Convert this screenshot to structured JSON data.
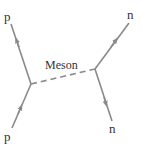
{
  "diagram": {
    "type": "feynman-diagram",
    "colors": {
      "line": "#8a8a8a",
      "text": "#333333",
      "background": "#ffffff"
    },
    "particles": {
      "top_left": {
        "label": "p"
      },
      "bottom_left": {
        "label": "p"
      },
      "top_right": {
        "label": "n"
      },
      "bottom_right": {
        "label": "n"
      }
    },
    "exchange": {
      "label": "Meson",
      "style": "dashed"
    }
  }
}
